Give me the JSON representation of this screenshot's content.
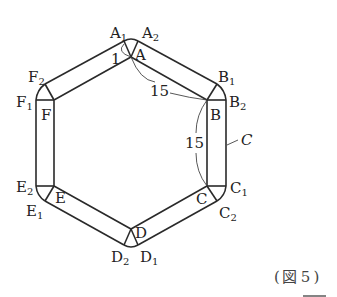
{
  "figure": {
    "caption": "（図 5）",
    "caption_parts": {
      "open": "(",
      "kanji": "図",
      "num": "5",
      "close": ")"
    }
  },
  "labels": {
    "A": "A",
    "A1": "A",
    "A1_sub": "1",
    "A2": "A",
    "A2_sub": "2",
    "B": "B",
    "B1": "B",
    "B1_sub": "1",
    "B2": "B",
    "B2_sub": "2",
    "C": "C",
    "C1": "C",
    "C1_sub": "1",
    "C2": "C",
    "C2_sub": "2",
    "D": "D",
    "D1": "D",
    "D1_sub": "1",
    "D2": "D",
    "D2_sub": "2",
    "E": "E",
    "E1": "E",
    "E1_sub": "1",
    "E2": "E",
    "E2_sub": "2",
    "F": "F",
    "F1": "F",
    "F1_sub": "1",
    "F2": "F",
    "F2_sub": "2",
    "curve": "C",
    "width": "1",
    "side_AB": "15",
    "side_BC": "15"
  },
  "colors": {
    "line": "#2a2a2a",
    "text": "#222222",
    "background": "#ffffff"
  }
}
